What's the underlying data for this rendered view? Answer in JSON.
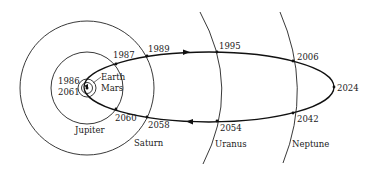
{
  "diagram": {
    "planets": {
      "earth": "Earth",
      "mars": "Mars",
      "jupiter": "Jupiter",
      "saturn": "Saturn",
      "uranus": "Uranus",
      "neptune": "Neptune"
    },
    "dates": {
      "perihelion_a": "1986",
      "perihelion_b": "2061",
      "jupiter_out": "1987",
      "saturn_out": "1989",
      "uranus_out": "1995",
      "neptune_out": "2006",
      "aphelion": "2024",
      "neptune_in": "2042",
      "uranus_in": "2054",
      "saturn_in": "2058",
      "jupiter_in": "2060"
    },
    "colors": {
      "line": "#111111",
      "background": "#ffffff"
    }
  }
}
